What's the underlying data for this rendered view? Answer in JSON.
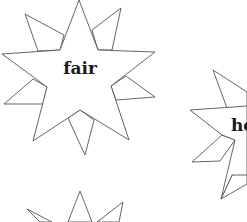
{
  "stars": [
    {
      "word": "fair",
      "label_x": 80,
      "label_y": 74
    },
    {
      "word": "he",
      "label_x": 231,
      "label_y": 131
    },
    {
      "word": "",
      "label_x": 80,
      "label_y": 250
    }
  ],
  "colors": {
    "stroke": "#555555",
    "text": "#1a1a1a",
    "background": "#ffffff"
  }
}
